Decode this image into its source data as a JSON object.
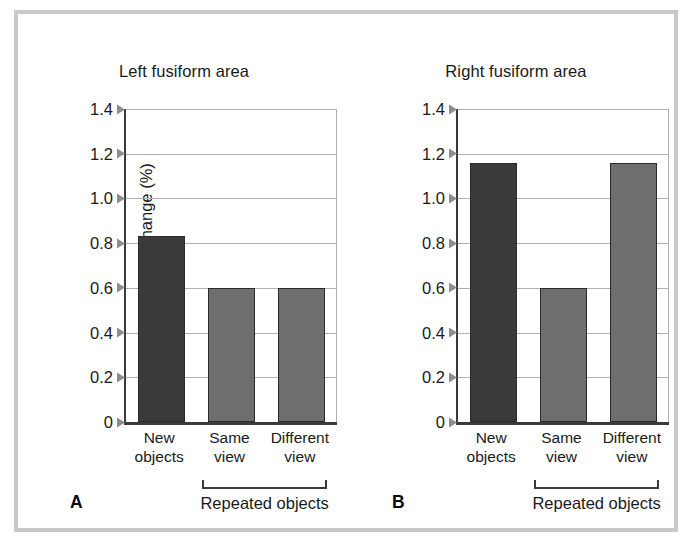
{
  "figure": {
    "frame_color": "#c9c9c9",
    "background": "#ffffff"
  },
  "chart_data": [
    {
      "type": "bar",
      "panel_letter": "A",
      "title": "Left fusiform area",
      "xlabel": "",
      "ylabel": "BOLD signal change (%)",
      "categories": [
        "New objects",
        "Same view",
        "Different view"
      ],
      "category_lines": [
        [
          "New",
          "objects"
        ],
        [
          "Same",
          "view"
        ],
        [
          "Different",
          "view"
        ]
      ],
      "values": [
        0.83,
        0.6,
        0.6
      ],
      "bar_colors": [
        "#3a3a3a",
        "#6e6e6e",
        "#6e6e6e"
      ],
      "ylim": [
        0,
        1.4
      ],
      "yticks": [
        "0",
        "0.2",
        "0.4",
        "0.6",
        "0.8",
        "1.0",
        "1.2",
        "1.4"
      ],
      "ytick_values": [
        0,
        0.2,
        0.4,
        0.6,
        0.8,
        1.0,
        1.2,
        1.4
      ],
      "grid": true,
      "legend": "none",
      "group_bracket_label": "Repeated objects",
      "group_bracket_covers": [
        "Same view",
        "Different view"
      ]
    },
    {
      "type": "bar",
      "panel_letter": "B",
      "title": "Right fusiform area",
      "xlabel": "",
      "ylabel": "BOLD signal change (%)",
      "categories": [
        "New objects",
        "Same view",
        "Different view"
      ],
      "category_lines": [
        [
          "New",
          "objects"
        ],
        [
          "Same",
          "view"
        ],
        [
          "Different",
          "view"
        ]
      ],
      "values": [
        1.16,
        0.6,
        1.16
      ],
      "bar_colors": [
        "#3a3a3a",
        "#6e6e6e",
        "#6e6e6e"
      ],
      "ylim": [
        0,
        1.4
      ],
      "yticks": [
        "0",
        "0.2",
        "0.4",
        "0.6",
        "0.8",
        "1.0",
        "1.2",
        "1.4"
      ],
      "ytick_values": [
        0,
        0.2,
        0.4,
        0.6,
        0.8,
        1.0,
        1.2,
        1.4
      ],
      "grid": true,
      "legend": "none",
      "group_bracket_label": "Repeated objects",
      "group_bracket_covers": [
        "Same view",
        "Different view"
      ]
    }
  ]
}
